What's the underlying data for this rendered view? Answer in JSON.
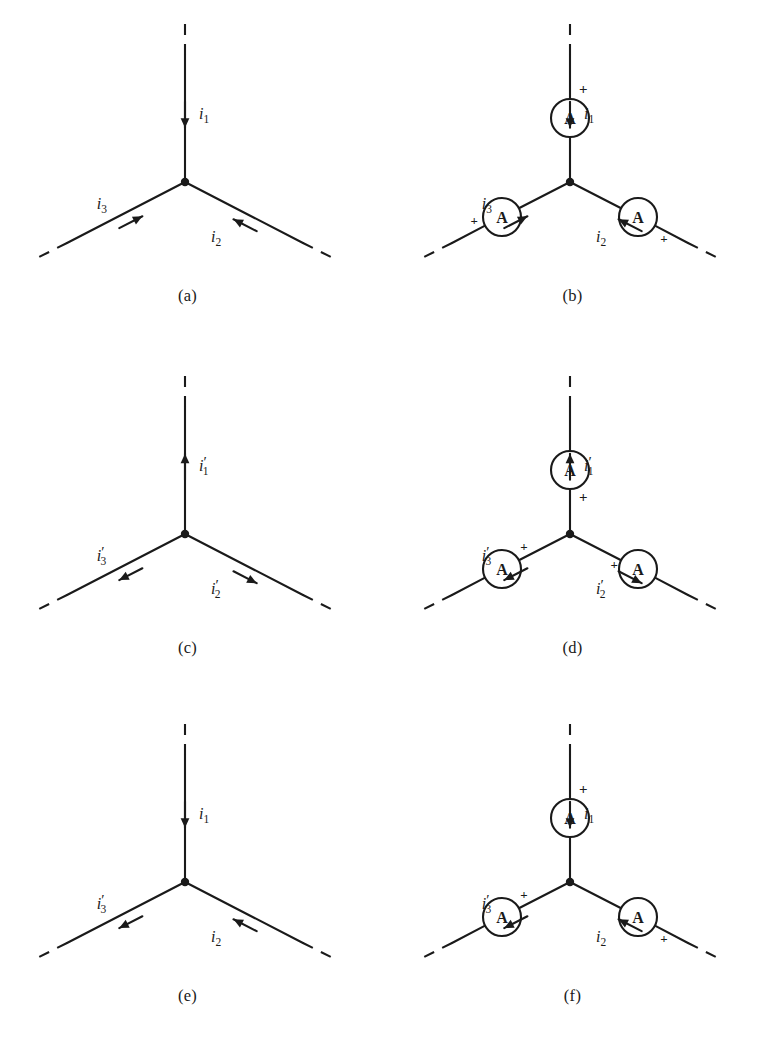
{
  "figure": {
    "background": "#ffffff",
    "stroke_color": "#1a1a1a",
    "meter_letter": "A",
    "plus_symbol": "+"
  },
  "geometry": {
    "node": {
      "x": 190,
      "y": 182
    },
    "top_end": {
      "x": 190,
      "y": 22
    },
    "top_solid_start": {
      "x": 190,
      "y": 55
    },
    "left_end": {
      "x": 42,
      "y": 258
    },
    "left_solid_end": {
      "x": 72,
      "y": 243
    },
    "right_end": {
      "x": 338,
      "y": 258
    },
    "right_solid_end": {
      "x": 308,
      "y": 243
    },
    "meter_radius": 19,
    "meter_top": {
      "x": 190,
      "y": 118
    },
    "meter_left": {
      "x": 122,
      "y": 217
    },
    "meter_right": {
      "x": 258,
      "y": 217
    }
  },
  "panels": [
    {
      "id": "a",
      "caption": "(a)",
      "has_meters": false,
      "branches": [
        {
          "name": "top",
          "label": "i",
          "sub": "1",
          "prime": false,
          "direction": "in"
        },
        {
          "name": "left",
          "label": "i",
          "sub": "3",
          "prime": false,
          "direction": "in"
        },
        {
          "name": "right",
          "label": "i",
          "sub": "2",
          "prime": false,
          "direction": "in"
        }
      ]
    },
    {
      "id": "b",
      "caption": "(b)",
      "has_meters": true,
      "branches": [
        {
          "name": "top",
          "label": "i",
          "sub": "1",
          "prime": false,
          "direction": "in",
          "plus_side": "outer"
        },
        {
          "name": "left",
          "label": "i",
          "sub": "3",
          "prime": false,
          "direction": "in",
          "plus_side": "outer"
        },
        {
          "name": "right",
          "label": "i",
          "sub": "2",
          "prime": false,
          "direction": "in",
          "plus_side": "outer"
        }
      ]
    },
    {
      "id": "c",
      "caption": "(c)",
      "has_meters": false,
      "branches": [
        {
          "name": "top",
          "label": "i",
          "sub": "1",
          "prime": true,
          "direction": "out"
        },
        {
          "name": "left",
          "label": "i",
          "sub": "3",
          "prime": true,
          "direction": "out"
        },
        {
          "name": "right",
          "label": "i",
          "sub": "2",
          "prime": true,
          "direction": "out"
        }
      ]
    },
    {
      "id": "d",
      "caption": "(d)",
      "has_meters": true,
      "branches": [
        {
          "name": "top",
          "label": "i",
          "sub": "1",
          "prime": true,
          "direction": "out",
          "plus_side": "inner"
        },
        {
          "name": "left",
          "label": "i",
          "sub": "3",
          "prime": true,
          "direction": "out",
          "plus_side": "inner"
        },
        {
          "name": "right",
          "label": "i",
          "sub": "2",
          "prime": true,
          "direction": "out",
          "plus_side": "inner"
        }
      ]
    },
    {
      "id": "e",
      "caption": "(e)",
      "has_meters": false,
      "branches": [
        {
          "name": "top",
          "label": "i",
          "sub": "1",
          "prime": false,
          "direction": "in"
        },
        {
          "name": "left",
          "label": "i",
          "sub": "3",
          "prime": true,
          "direction": "out"
        },
        {
          "name": "right",
          "label": "i",
          "sub": "2",
          "prime": false,
          "direction": "in"
        }
      ]
    },
    {
      "id": "f",
      "caption": "(f)",
      "has_meters": true,
      "branches": [
        {
          "name": "top",
          "label": "i",
          "sub": "1",
          "prime": false,
          "direction": "in",
          "plus_side": "outer"
        },
        {
          "name": "left",
          "label": "i",
          "sub": "3",
          "prime": true,
          "direction": "out",
          "plus_side": "inner"
        },
        {
          "name": "right",
          "label": "i",
          "sub": "2",
          "prime": false,
          "direction": "in",
          "plus_side": "outer"
        }
      ]
    }
  ]
}
